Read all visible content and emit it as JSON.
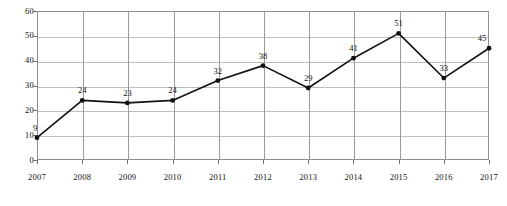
{
  "chart_data": {
    "type": "line",
    "title": "",
    "subtitle": "",
    "xlabel": "",
    "ylabel": "",
    "categories": [
      "2007",
      "2008",
      "2009",
      "2010",
      "2011",
      "2012",
      "2013",
      "2014",
      "2015",
      "2016",
      "2017"
    ],
    "values": [
      9,
      24,
      23,
      24,
      32,
      38,
      29,
      41,
      51,
      33,
      45
    ],
    "point_labels": [
      "9",
      "24",
      "23",
      "24",
      "32",
      "38",
      "29",
      "41",
      "51",
      "33",
      "45"
    ],
    "ylim": [
      0,
      60
    ],
    "y_ticks": [
      0,
      10,
      20,
      30,
      40,
      50,
      60
    ],
    "y_tick_labels": [
      "0",
      "10",
      "20",
      "30",
      "40",
      "50",
      "60"
    ],
    "grid": "both",
    "legend": "none",
    "series": [
      {
        "name": "",
        "values": [
          9,
          24,
          23,
          24,
          32,
          38,
          29,
          41,
          51,
          33,
          45
        ],
        "color": "#111111",
        "marker": "circle",
        "line_style": "solid"
      }
    ],
    "colors": {
      "line": "#111111",
      "marker": "#111111",
      "gridline_horizontal": "#bdbdbd",
      "gridline_vertical": "#9a9a9a",
      "frame": "#8f8f8f",
      "text": "#111111",
      "background": "#ffffff"
    }
  },
  "axes": {
    "y_axis_name": "value-axis",
    "x_axis_name": "year-axis"
  },
  "caption": {
    "text": ""
  }
}
